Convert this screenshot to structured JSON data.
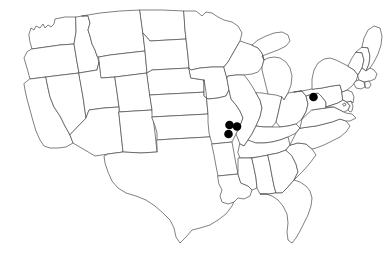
{
  "figure": {
    "kind": "map",
    "title": "",
    "caption": "",
    "region": "United States (contiguous 48 states)",
    "projection": "albers-usa-like",
    "background_color": "#ffffff",
    "state_border_color": "#4a4a4a",
    "nation_border_color": "#2b2b2b",
    "dot_color": "#000000",
    "dot_radius_px": 4.3,
    "width_px": 387,
    "height_px": 255
  },
  "legend": {
    "present": false,
    "entries": []
  },
  "labels": {
    "present": false,
    "items": []
  },
  "chart_data": {
    "type": "scatter",
    "title": "",
    "xlabel": "",
    "ylabel": "",
    "basemap": "United States state outlines",
    "marker": {
      "shape": "circle",
      "color": "#000000",
      "radius_px": 4.3,
      "count": 4
    },
    "points": [
      {
        "id": "mo-1",
        "state": "Missouri",
        "x_px": 229.5,
        "y_px": 125.0
      },
      {
        "id": "mo-2",
        "state": "Missouri",
        "x_px": 237.0,
        "y_px": 126.5
      },
      {
        "id": "mo-3",
        "state": "Missouri",
        "x_px": 228.5,
        "y_px": 134.0
      },
      {
        "id": "pa-1",
        "state": "Pennsylvania",
        "x_px": 313.5,
        "y_px": 97.0
      }
    ],
    "state_counts": [
      {
        "state": "Missouri",
        "count": 3
      },
      {
        "state": "Pennsylvania",
        "count": 1
      }
    ]
  },
  "states": {
    "count": 49,
    "names": [
      "Washington",
      "Oregon",
      "California",
      "Nevada",
      "Idaho",
      "Montana",
      "Wyoming",
      "Utah",
      "Arizona",
      "Colorado",
      "New Mexico",
      "North Dakota",
      "South Dakota",
      "Nebraska",
      "Kansas",
      "Oklahoma",
      "Texas",
      "Minnesota",
      "Iowa",
      "Missouri",
      "Arkansas",
      "Louisiana",
      "Wisconsin",
      "Illinois",
      "Michigan",
      "Indiana",
      "Ohio",
      "Kentucky",
      "Tennessee",
      "Mississippi",
      "Alabama",
      "Georgia",
      "Florida",
      "South Carolina",
      "North Carolina",
      "Virginia",
      "West Virginia",
      "Maryland",
      "Delaware",
      "New Jersey",
      "Pennsylvania",
      "New York",
      "Connecticut",
      "Rhode Island",
      "Massachusetts",
      "Vermont",
      "New Hampshire",
      "Maine",
      "District of Columbia"
    ]
  }
}
